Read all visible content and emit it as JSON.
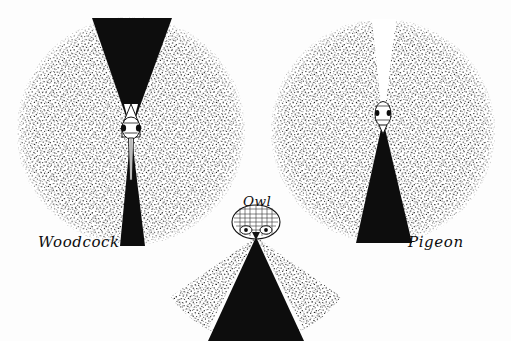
{
  "figure": {
    "background_color": "#fdfdfd",
    "ink_color": "#0d0d0d",
    "stipple_color": "#2b2b2b"
  },
  "diagrams": [
    {
      "id": "woodcock",
      "label": "Woodcock",
      "label_x": 38,
      "label_y": 247,
      "shape": "full-circle",
      "center_x": 131,
      "center_y": 131,
      "radius": 114,
      "monocular_fill": "stipple",
      "binocular_fill": "#0d0d0d",
      "blind_fill": "#ffffff",
      "binocular_front_start_deg": 249,
      "binocular_front_end_deg": 291,
      "binocular_rear_start_deg": 80,
      "binocular_rear_end_deg": 100,
      "blind_deg": 0,
      "head_orientation": "up",
      "head_cx": 131,
      "head_cy": 128
    },
    {
      "id": "pigeon",
      "label": "Pigeon",
      "label_x": 408,
      "label_y": 247,
      "shape": "full-circle",
      "center_x": 383,
      "center_y": 131,
      "radius": 112,
      "monocular_fill": "stipple",
      "binocular_fill": "#0d0d0d",
      "blind_fill": "#ffffff",
      "binocular_front_start_deg": 76,
      "binocular_front_end_deg": 104,
      "blind_rear_start_deg": 264,
      "blind_rear_end_deg": 276,
      "head_orientation": "up",
      "head_cx": 383,
      "head_cy": 118
    },
    {
      "id": "owl",
      "label": "Owl",
      "label_x": 243,
      "label_y": 206,
      "shape": "fan-sector",
      "center_x": 256,
      "center_y": 237,
      "radius": 104,
      "monocular_fill": "stipple",
      "binocular_fill": "#0d0d0d",
      "sector_start_deg": 35,
      "sector_end_deg": 145,
      "binocular_start_deg": 62,
      "binocular_end_deg": 118,
      "head_orientation": "down",
      "head_cx": 256,
      "head_cy": 222
    }
  ],
  "legend_keys": {
    "binocular": "binocular field (black)",
    "monocular": "monocular field (stippled)",
    "blind": "blind area (white)"
  }
}
